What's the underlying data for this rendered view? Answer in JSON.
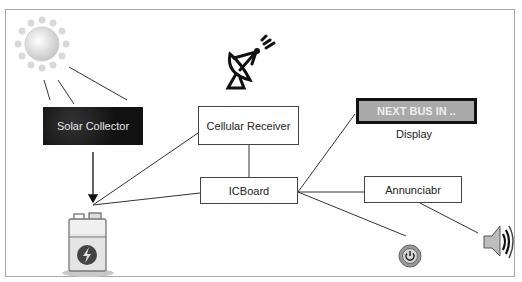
{
  "diagram": {
    "nodes": {
      "solar_collector": "Solar Collector",
      "cellular_receiver": "Cellular Receiver",
      "ic_board": "ICBoard",
      "display_screen": "NEXT BUS IN ..",
      "display_label": "Display",
      "annunciator": "Annunciabr"
    },
    "icons": [
      "sun-icon",
      "satellite-dish-icon",
      "battery-icon",
      "power-button-icon",
      "speaker-icon"
    ],
    "colors": {
      "solar_fill": "#1e1e1e",
      "display_fill": "#a9a9a9",
      "line": "#333333"
    }
  }
}
